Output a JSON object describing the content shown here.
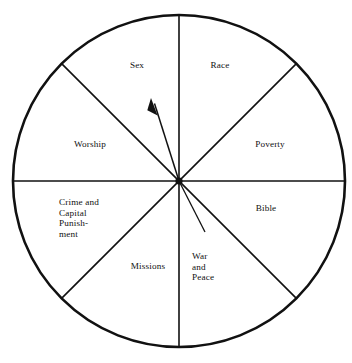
{
  "figure": {
    "type": "sector-wheel-diagram",
    "shape": "circle",
    "sector_count": 8,
    "stroke_color": "#111111",
    "fill_color": "#ffffff",
    "background_color": "#ffffff",
    "geometry": {
      "center_x": 179,
      "center_y": 181,
      "radius": 166,
      "outer_stroke_width": 2.6,
      "divider_stroke_width": 1.5
    },
    "sectors": [
      {
        "key": "sex",
        "label": "Sex",
        "angle_start_deg": 90,
        "angle_end_deg": 135
      },
      {
        "key": "race",
        "label": "Race",
        "angle_start_deg": 45,
        "angle_end_deg": 90
      },
      {
        "key": "poverty",
        "label": "Poverty",
        "angle_start_deg": 0,
        "angle_end_deg": 45
      },
      {
        "key": "bible",
        "label": "Bible",
        "angle_start_deg": -45,
        "angle_end_deg": 0
      },
      {
        "key": "war",
        "label": "War\nand\nPeace",
        "angle_start_deg": -90,
        "angle_end_deg": -45
      },
      {
        "key": "missions",
        "label": "Missions",
        "angle_start_deg": -135,
        "angle_end_deg": -90
      },
      {
        "key": "crime",
        "label": "Crime and\nCapital\nPunish-\nment",
        "angle_start_deg": 180,
        "angle_end_deg": -135
      },
      {
        "key": "worship",
        "label": "Worship",
        "angle_start_deg": 135,
        "angle_end_deg": 180
      }
    ],
    "pointer": {
      "name": "needle-arrow",
      "tip_x": 151,
      "tip_y": 99,
      "tail_x": 205,
      "tail_y": 232,
      "stroke_width": 1.4,
      "arrowhead": "filled-triangle",
      "points_to": "Sex"
    }
  }
}
